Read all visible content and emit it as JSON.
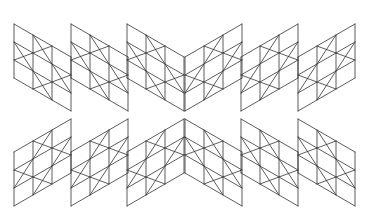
{
  "figure": {
    "stroke_color": "#333333",
    "background_color": "#ffffff",
    "stroke_width": 0.8,
    "axis_x": 184.5,
    "panel_width": 57,
    "panel_height": 54,
    "slope_rise": 33,
    "grid_cells": 3,
    "left_half_origins_x": [
      14,
      71,
      127
    ],
    "upper_top_left_y": 24,
    "lower_bottom_left_y": 206,
    "x_cells": [
      [
        0,
        1
      ],
      [
        1,
        0
      ],
      [
        1,
        2
      ],
      [
        2,
        1
      ]
    ]
  }
}
